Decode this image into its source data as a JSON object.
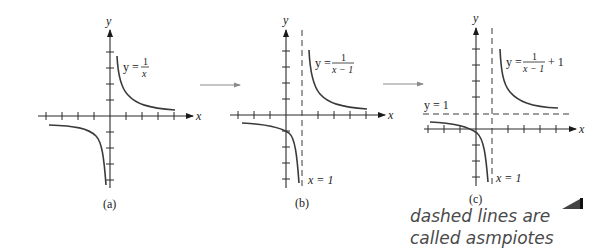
{
  "figure": {
    "panels": [
      {
        "id": "a",
        "caption": "(a)",
        "equation": {
          "lhs": "y =",
          "num": "1",
          "den": "x"
        },
        "axis_x_label": "x",
        "axis_y_label": "y",
        "asymptotes": {
          "vertical": 0,
          "horizontal": 0
        },
        "vertical_asymptote_label": "",
        "horizontal_asymptote_label": ""
      },
      {
        "id": "b",
        "caption": "(b)",
        "equation": {
          "lhs": "y =",
          "num": "1",
          "den": "x − 1"
        },
        "axis_x_label": "x",
        "axis_y_label": "y",
        "asymptotes": {
          "vertical": 1,
          "horizontal": 0
        },
        "vertical_asymptote_label": "x = 1",
        "horizontal_asymptote_label": ""
      },
      {
        "id": "c",
        "caption": "(c)",
        "equation": {
          "lhs": "y =",
          "num": "1",
          "den": "x − 1",
          "suffix": "+ 1"
        },
        "axis_x_label": "x",
        "axis_y_label": "y",
        "asymptotes": {
          "vertical": 1,
          "horizontal": 1
        },
        "vertical_asymptote_label": "x = 1",
        "horizontal_asymptote_label": "y = 1"
      }
    ],
    "transform_arrows": 2,
    "handwritten_note": {
      "line1": "dashed lines are",
      "line2": "called asmpiotes"
    },
    "colors": {
      "ink": "#2a2a2a",
      "curve": "#3a3a3a",
      "arrow": "#8a8a8a",
      "note": "#4a4a4a"
    }
  }
}
